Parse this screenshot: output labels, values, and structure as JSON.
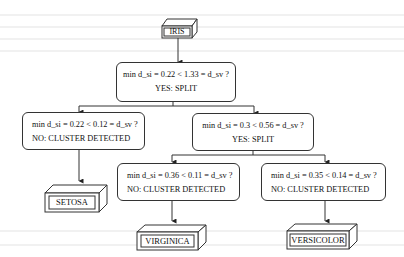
{
  "diagram": {
    "type": "decision-tree",
    "root": {
      "label": "IRIS"
    },
    "nodes": [
      {
        "id": "n1",
        "question": "min d_si = 0.22 < 1.33 = d_sv ?",
        "answer": "YES: SPLIT"
      },
      {
        "id": "n2",
        "question": "min d_si = 0.22 < 0.12 = d_sv ?",
        "answer": "NO: CLUSTER DETECTED"
      },
      {
        "id": "n3",
        "question": "min d_si = 0.3 < 0.56 = d_sv ?",
        "answer": "YES: SPLIT"
      },
      {
        "id": "n4",
        "question": "min d_si = 0.36 < 0.11 = d_sv ?",
        "answer": "NO: CLUSTER DETECTED"
      },
      {
        "id": "n5",
        "question": "min d_si = 0.35 < 0.14 = d_sv ?",
        "answer": "NO: CLUSTER DETECTED"
      }
    ],
    "leaves": [
      {
        "id": "l1",
        "label": "SETOSA"
      },
      {
        "id": "l2",
        "label": "VIRGINICA"
      },
      {
        "id": "l3",
        "label": "VERSICOLOR"
      }
    ],
    "edges": [
      [
        "root",
        "n1"
      ],
      [
        "n1",
        "n2"
      ],
      [
        "n1",
        "n3"
      ],
      [
        "n2",
        "l1"
      ],
      [
        "n3",
        "n4"
      ],
      [
        "n3",
        "n5"
      ],
      [
        "n4",
        "l2"
      ],
      [
        "n5",
        "l3"
      ]
    ]
  }
}
